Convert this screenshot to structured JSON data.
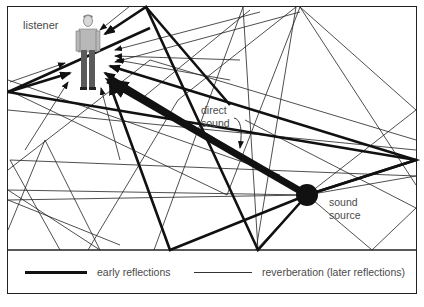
{
  "diagram": {
    "title": "",
    "labels": {
      "listener": "listener",
      "direct_sound_line1": "direct",
      "direct_sound_line2": "sound",
      "sound_source_line1": "sound",
      "sound_source_line2": "source"
    },
    "nodes": [
      {
        "id": "listener",
        "type": "person-figure",
        "x": 88,
        "y": 55
      },
      {
        "id": "sound_source",
        "type": "filled-circle",
        "x": 307,
        "y": 195
      }
    ],
    "edges": [
      {
        "from": "sound_source",
        "to": "listener",
        "kind": "direct sound",
        "style": "very thick arrow"
      },
      {
        "from": "sound_source",
        "to": "listener",
        "kind": "early reflections",
        "style": "thick arrows"
      },
      {
        "from": "sound_source",
        "to": "listener",
        "kind": "reverberation (later reflections)",
        "style": "thin arrows"
      }
    ],
    "colors": {
      "line": "#111111",
      "text": "#4a4a4a",
      "background": "#ffffff",
      "figure_shirt": "#b8b8b8",
      "figure_pants": "#5a5a5a"
    }
  },
  "legend": {
    "early": "early reflections",
    "reverb": "reverberation (later reflections)"
  }
}
